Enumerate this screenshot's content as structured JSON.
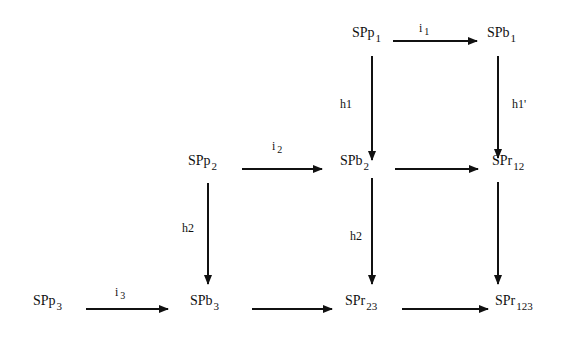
{
  "diagram": {
    "type": "commutative-diagram",
    "nodes": [
      {
        "id": "SPp1",
        "base": "SPp",
        "sub": "1",
        "x": 352,
        "y": 34
      },
      {
        "id": "SPb1",
        "base": "SPb",
        "sub": "1",
        "x": 487,
        "y": 34
      },
      {
        "id": "SPp2",
        "base": "SPp",
        "sub": "2",
        "x": 188,
        "y": 162
      },
      {
        "id": "SPb2",
        "base": "SPb",
        "sub": "2",
        "x": 340,
        "y": 162
      },
      {
        "id": "SPr12",
        "base": "SPr",
        "sub": "12",
        "x": 492,
        "y": 162
      },
      {
        "id": "SPp3",
        "base": "SPp",
        "sub": "3",
        "x": 33,
        "y": 302
      },
      {
        "id": "SPb3",
        "base": "SPb",
        "sub": "3",
        "x": 190,
        "y": 302
      },
      {
        "id": "SPr23",
        "base": "SPr",
        "sub": "23",
        "x": 345,
        "y": 302
      },
      {
        "id": "SPr123",
        "base": "SPr",
        "sub": "123",
        "x": 495,
        "y": 302
      }
    ],
    "edges": [
      {
        "from": "SPp1",
        "to": "SPb1",
        "label": "i",
        "label_sub": "1",
        "x1": 393,
        "y1": 41,
        "x2": 477,
        "y2": 41,
        "lx": 419,
        "ly": 22
      },
      {
        "from": "SPp1",
        "to": "SPb2",
        "label": "h1",
        "label_sub": "",
        "x1": 372,
        "y1": 56,
        "x2": 372,
        "y2": 160,
        "lx": 340,
        "ly": 98
      },
      {
        "from": "SPb1",
        "to": "SPr12",
        "label": "h1'",
        "label_sub": "",
        "x1": 498,
        "y1": 56,
        "x2": 498,
        "y2": 158,
        "lx": 512,
        "ly": 98
      },
      {
        "from": "SPp2",
        "to": "SPb2",
        "label": "i",
        "label_sub": "2",
        "x1": 242,
        "y1": 169,
        "x2": 322,
        "y2": 169,
        "lx": 272,
        "ly": 140
      },
      {
        "from": "SPb2",
        "to": "SPr12",
        "label": "",
        "label_sub": "",
        "x1": 395,
        "y1": 169,
        "x2": 478,
        "y2": 169,
        "lx": 0,
        "ly": 0
      },
      {
        "from": "SPp2",
        "to": "SPb3",
        "label": "h2",
        "label_sub": "",
        "x1": 208,
        "y1": 183,
        "x2": 208,
        "y2": 284,
        "lx": 182,
        "ly": 222
      },
      {
        "from": "SPb2",
        "to": "SPr23",
        "label": "h2",
        "label_sub": "",
        "x1": 372,
        "y1": 178,
        "x2": 372,
        "y2": 284,
        "lx": 350,
        "ly": 230
      },
      {
        "from": "SPr12",
        "to": "SPr123",
        "label": "",
        "label_sub": "",
        "x1": 498,
        "y1": 182,
        "x2": 498,
        "y2": 284,
        "lx": 0,
        "ly": 0
      },
      {
        "from": "SPp3",
        "to": "SPb3",
        "label": "i",
        "label_sub": "3",
        "x1": 86,
        "y1": 309,
        "x2": 168,
        "y2": 309,
        "lx": 115,
        "ly": 286
      },
      {
        "from": "SPb3",
        "to": "SPr23",
        "label": "",
        "label_sub": "",
        "x1": 252,
        "y1": 309,
        "x2": 332,
        "y2": 309,
        "lx": 0,
        "ly": 0
      },
      {
        "from": "SPr23",
        "to": "SPr123",
        "label": "",
        "label_sub": "",
        "x1": 402,
        "y1": 309,
        "x2": 488,
        "y2": 309,
        "lx": 0,
        "ly": 0
      }
    ]
  }
}
